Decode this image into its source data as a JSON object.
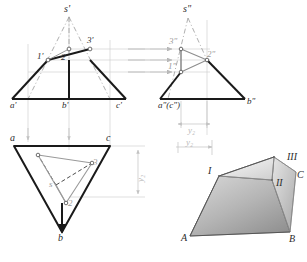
{
  "figure": {
    "type": "descriptive-geometry-orthographic-projection",
    "colors": {
      "outline": "#1a1a1a",
      "thin": "#b3b3b3",
      "section": "#8e8e8e",
      "shade_light": "#e8e8e8",
      "shade_mid": "#bcbcbc",
      "shade_dark": "#9a9a9a",
      "dimension": "#c2c2c2"
    }
  },
  "front_view": {
    "name": "V-projection (frontal)",
    "labels": {
      "apex": "s'",
      "p1": "1'",
      "p2": "2'",
      "p3": "3'",
      "a": "a'",
      "b": "b'",
      "c": "c'"
    }
  },
  "side_view": {
    "name": "W-projection (profile)",
    "labels": {
      "apex": "s\"",
      "p1": "1\"",
      "p2": "2\"",
      "p3": "3\"",
      "ac": "a\"(c\")",
      "b": "b\"",
      "dimension": "y₂"
    }
  },
  "top_view": {
    "name": "H-projection (horizontal)",
    "labels": {
      "apex": "s",
      "p1": "1",
      "p2": "2",
      "p3": "3",
      "a": "a",
      "b": "b",
      "c": "c",
      "dimension": "y₂"
    }
  },
  "pictorial_view": {
    "name": "3D axonometric view",
    "labels": {
      "p1": "I",
      "p2": "II",
      "p3": "III",
      "a": "A",
      "b": "B",
      "c": "C"
    }
  },
  "projection_arrows": {
    "count": 3,
    "direction": "left-to-right"
  }
}
